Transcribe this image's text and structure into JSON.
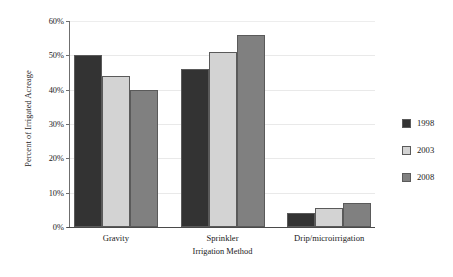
{
  "chart_data": {
    "type": "bar",
    "title": "",
    "subtitle": "",
    "xlabel": "Irrigation Method",
    "ylabel": "Percent of Irrigated Acreage",
    "categories": [
      "Gravity",
      "Sprinkler",
      "Drip/microirrigation"
    ],
    "series": [
      {
        "name": "1998",
        "color": "#333333",
        "values": [
          50,
          46,
          4
        ]
      },
      {
        "name": "2003",
        "color": "#d3d3d3",
        "values": [
          44,
          51,
          5.5
        ]
      },
      {
        "name": "2008",
        "color": "#808080",
        "values": [
          40,
          56,
          7
        ]
      }
    ],
    "ylim": [
      0,
      60
    ],
    "ytick_values": [
      0,
      10,
      20,
      30,
      40,
      50,
      60
    ],
    "ytick_labels": [
      "0%",
      "10%",
      "20%",
      "30%",
      "40%",
      "50%",
      "60%"
    ],
    "grid": true,
    "grid_axis": "y",
    "legend_position": "right",
    "bar_border_color": "#5a5a5a",
    "background_color": "#ffffff",
    "gridline_color": "#e9e9e9",
    "axis_color": "#4a4a4a"
  },
  "legend": {
    "entries": [
      {
        "label": "1998",
        "color": "#333333"
      },
      {
        "label": "2003",
        "color": "#d3d3d3"
      },
      {
        "label": "2008",
        "color": "#808080"
      }
    ]
  }
}
